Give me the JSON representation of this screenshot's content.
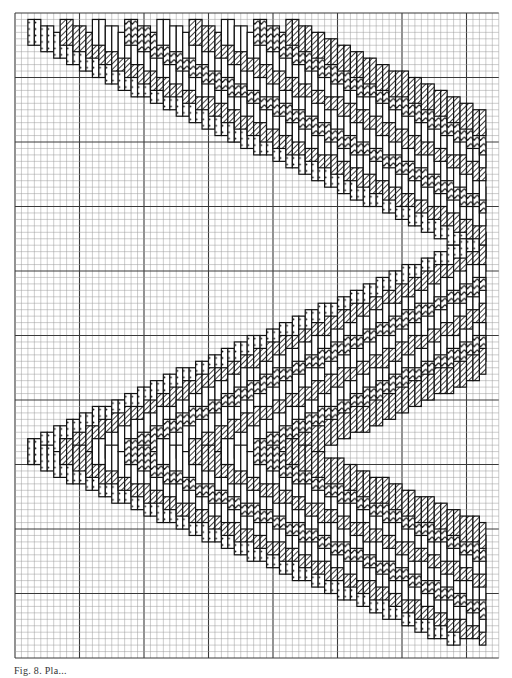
{
  "figure": {
    "caption": "Fig. 8. Pla...",
    "type": "needlepoint bargello chart on graph paper"
  },
  "grid": {
    "left": 15,
    "top": 13,
    "cols": 75,
    "rows": 100,
    "cell": 6.45,
    "major_every": 10,
    "minor_color": "#9a9a9a",
    "major_color": "#3a3a3a"
  },
  "pattern": {
    "motif": "horizontal chevron / zigzag (arrowhead) bargello",
    "stitch_length_cells": 4,
    "step_cells": 1,
    "tips": [
      {
        "side": "left",
        "row": 3
      },
      {
        "side": "right",
        "row": 36
      },
      {
        "side": "left",
        "row": 68
      },
      {
        "side": "right",
        "row": 98
      }
    ],
    "left_tip_col": 2,
    "right_tip_col": 72,
    "bands": [
      {
        "offset": 0,
        "fill": "dots"
      },
      {
        "offset": 5,
        "fill": "hatch"
      },
      {
        "offset": 10,
        "fill": "outline"
      },
      {
        "offset": 15,
        "fill": "zigzag"
      },
      {
        "offset": 20,
        "fill": "outline"
      },
      {
        "offset": 25,
        "fill": "hatch"
      },
      {
        "offset": 30,
        "fill": "outline"
      },
      {
        "offset": 35,
        "fill": "zigzag"
      },
      {
        "offset": 40,
        "fill": "hatch"
      }
    ],
    "legend": [
      {
        "symbol": "dots",
        "meaning": "dotted stitch color"
      },
      {
        "symbol": "hatch",
        "meaning": "diagonal hatched stitch color"
      },
      {
        "symbol": "zigzag",
        "meaning": "chevron-marked stitch color"
      },
      {
        "symbol": "outline",
        "meaning": "open/blank stitch color"
      }
    ]
  }
}
